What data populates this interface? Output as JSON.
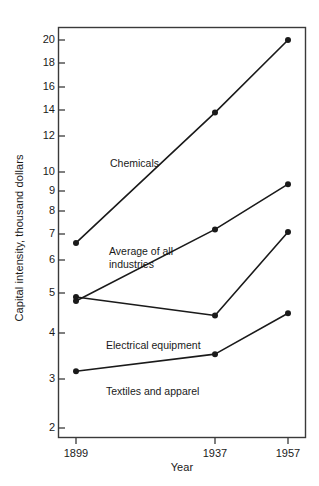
{
  "chart_data": {
    "type": "line",
    "title": "",
    "xlabel": "Year",
    "ylabel": "Capital intensity, thousand dollars",
    "x": [
      1899,
      1937,
      1957
    ],
    "xtick_labels": [
      "1899",
      "1937",
      "1957"
    ],
    "yscale": "log",
    "ylim": [
      1.85,
      21.5
    ],
    "ytick_values": [
      2,
      3,
      4,
      5,
      6,
      7,
      8,
      9,
      10,
      12,
      14,
      16,
      18,
      20
    ],
    "ytick_labels": [
      "2",
      "3",
      "4",
      "5",
      "6",
      "7",
      "8",
      "9",
      "10",
      "12",
      "14",
      "16",
      "18",
      "20"
    ],
    "grid": false,
    "legend": "inline-annotations",
    "marker": "filled-circle",
    "line_color": "#1a1a1a",
    "series": [
      {
        "name": "Chemicals",
        "values": [
          6.0,
          13.0,
          20.0
        ],
        "label_text": "Chemicals"
      },
      {
        "name": "Average of all industries",
        "values": [
          4.25,
          6.5,
          8.5
        ],
        "label_text": "Average of all\nindustries"
      },
      {
        "name": "Electrical equipment",
        "values": [
          4.35,
          3.9,
          6.4
        ],
        "label_text": "Electrical equipment"
      },
      {
        "name": "Textiles and apparel",
        "values": [
          2.8,
          3.1,
          3.95
        ],
        "label_text": "Textiles and apparel"
      }
    ]
  },
  "colors": {
    "ink": "#1a1a1a",
    "background": "#ffffff",
    "axis": "#3a3a3a"
  }
}
